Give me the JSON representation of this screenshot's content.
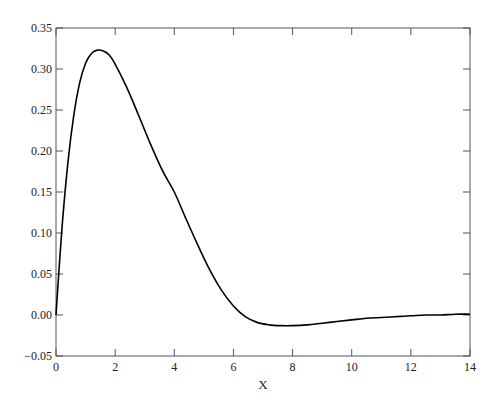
{
  "chart_data": {
    "type": "line",
    "title": "",
    "xlabel": "X",
    "ylabel": "",
    "xlim": [
      0,
      14
    ],
    "ylim": [
      -0.05,
      0.35
    ],
    "xticks": [
      0,
      2,
      4,
      6,
      8,
      10,
      12,
      14
    ],
    "xtick_labels": [
      "0",
      "2",
      "4",
      "6",
      "8",
      "10",
      "12",
      "14"
    ],
    "yticks": [
      -0.05,
      0.0,
      0.05,
      0.1,
      0.15,
      0.2,
      0.25,
      0.3,
      0.35
    ],
    "ytick_labels": [
      "−0.05",
      "0.00",
      "0.05",
      "0.10",
      "0.15",
      "0.20",
      "0.25",
      "0.30",
      "0.35"
    ],
    "grid": false,
    "legend": null,
    "series": [
      {
        "name": "curve",
        "color": "#000000",
        "x": [
          0,
          0.2,
          0.4,
          0.6,
          0.8,
          1.0,
          1.2,
          1.4,
          1.6,
          1.8,
          2.0,
          2.4,
          2.8,
          3.2,
          3.6,
          4.0,
          4.4,
          4.8,
          5.2,
          5.6,
          6.0,
          6.4,
          6.8,
          7.2,
          7.6,
          8.0,
          8.5,
          9.0,
          9.5,
          10.0,
          10.5,
          11.0,
          11.5,
          12.0,
          12.5,
          13.0,
          13.5,
          14.0
        ],
        "y": [
          0.0,
          0.105,
          0.185,
          0.243,
          0.283,
          0.307,
          0.319,
          0.323,
          0.322,
          0.317,
          0.306,
          0.277,
          0.243,
          0.208,
          0.176,
          0.15,
          0.117,
          0.085,
          0.055,
          0.03,
          0.011,
          -0.002,
          -0.009,
          -0.012,
          -0.013,
          -0.013,
          -0.012,
          -0.01,
          -0.008,
          -0.006,
          -0.004,
          -0.003,
          -0.002,
          -0.001,
          0.0,
          0.0,
          0.001,
          0.001
        ]
      }
    ]
  }
}
